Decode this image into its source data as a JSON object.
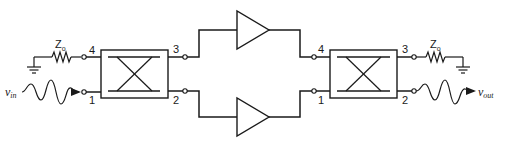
{
  "diagram": {
    "type": "balanced-amplifier",
    "colors": {
      "line": "#1a1a1a",
      "background": "#ffffff"
    },
    "input": {
      "symbol": "v",
      "subscript": "in",
      "icon": "sine-wave-arrow-icon"
    },
    "output": {
      "symbol": "v",
      "subscript": "out",
      "icon": "sine-wave-arrow-icon"
    },
    "left_termination": {
      "symbol": "Z",
      "subscript": "o",
      "icon": "resistor-icon",
      "ground": "ground-icon"
    },
    "right_termination": {
      "symbol": "Z",
      "subscript": "o",
      "icon": "resistor-icon",
      "ground": "ground-icon"
    },
    "left_coupler": {
      "icon": "hybrid-coupler-icon",
      "ports": {
        "top_left": "4",
        "bottom_left": "1",
        "top_right": "3",
        "bottom_right": "2"
      }
    },
    "right_coupler": {
      "icon": "hybrid-coupler-icon",
      "ports": {
        "top_left": "4",
        "bottom_left": "1",
        "top_right": "3",
        "bottom_right": "2"
      }
    },
    "amplifiers": [
      {
        "name": "upper-amplifier",
        "icon": "amplifier-triangle-icon"
      },
      {
        "name": "lower-amplifier",
        "icon": "amplifier-triangle-icon"
      }
    ]
  }
}
